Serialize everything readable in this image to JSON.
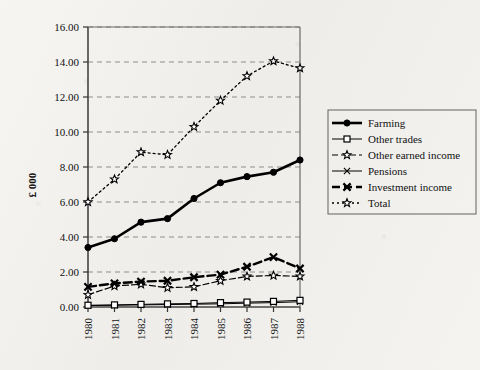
{
  "chart_data": {
    "type": "line",
    "title": "",
    "xlabel": "",
    "ylabel": "£ 000",
    "x": [
      1980,
      1981,
      1982,
      1983,
      1984,
      1985,
      1986,
      1987,
      1988
    ],
    "categories": [
      "1980",
      "1981",
      "1982",
      "1983",
      "1984",
      "1985",
      "1986",
      "1987",
      "1988"
    ],
    "ylim": [
      0.0,
      16.0
    ],
    "ytick_step": 2.0,
    "ytick_labels": [
      "0.00",
      "2.00",
      "4.00",
      "6.00",
      "8.00",
      "10.00",
      "12.00",
      "14.00",
      "16.00"
    ],
    "ytick_values": [
      0.0,
      2.0,
      4.0,
      6.0,
      8.0,
      10.0,
      12.0,
      14.0,
      16.0
    ],
    "grid": "horizontal-dashed",
    "legend_position": "right",
    "series": [
      {
        "name": "Farming",
        "marker": "filled-circle",
        "line": "solid-bold",
        "values": [
          3.4,
          3.9,
          4.85,
          5.05,
          6.2,
          7.1,
          7.45,
          7.7,
          8.4
        ]
      },
      {
        "name": "Other trades",
        "marker": "open-square",
        "line": "solid-thin",
        "values": [
          0.1,
          0.12,
          0.15,
          0.18,
          0.2,
          0.25,
          0.28,
          0.32,
          0.38
        ]
      },
      {
        "name": "Other earned income",
        "marker": "open-star",
        "line": "dashed",
        "values": [
          0.7,
          1.2,
          1.3,
          1.1,
          1.15,
          1.5,
          1.75,
          1.8,
          1.75
        ]
      },
      {
        "name": "Pensions",
        "marker": "cross-x",
        "line": "solid-thin",
        "values": [
          0.08,
          0.1,
          0.12,
          0.14,
          0.16,
          0.18,
          0.22,
          0.25,
          0.3
        ]
      },
      {
        "name": "Investment income",
        "marker": "bold-x",
        "line": "dashed-bold",
        "values": [
          1.15,
          1.35,
          1.45,
          1.5,
          1.7,
          1.85,
          2.3,
          2.85,
          2.2
        ]
      },
      {
        "name": "Total",
        "marker": "open-star",
        "line": "dotted-dashed",
        "values": [
          6.0,
          7.3,
          8.85,
          8.7,
          10.3,
          11.8,
          13.2,
          14.05,
          13.65
        ]
      }
    ]
  },
  "legend": {
    "items": [
      {
        "label": "Farming"
      },
      {
        "label": "Other trades"
      },
      {
        "label": "Other earned income"
      },
      {
        "label": "Pensions"
      },
      {
        "label": "Investment income"
      },
      {
        "label": "Total"
      }
    ]
  },
  "axes": {
    "y_title": "£ 000"
  }
}
